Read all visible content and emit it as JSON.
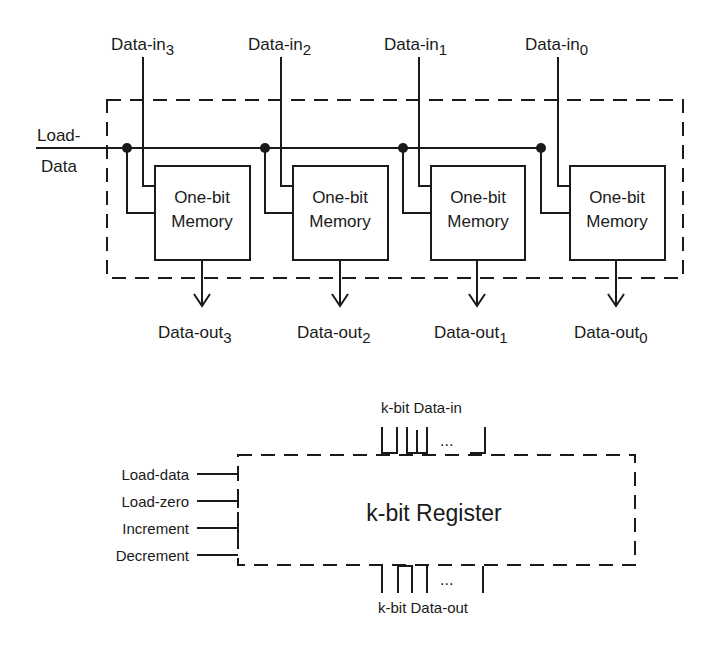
{
  "top_diagram": {
    "load_label_line1": "Load-",
    "load_label_line2": "Data",
    "data_in": [
      {
        "base": "Data-in",
        "sub": "3"
      },
      {
        "base": "Data-in",
        "sub": "2"
      },
      {
        "base": "Data-in",
        "sub": "1"
      },
      {
        "base": "Data-in",
        "sub": "0"
      }
    ],
    "cells": [
      {
        "line1": "One-bit",
        "line2": "Memory"
      },
      {
        "line1": "One-bit",
        "line2": "Memory"
      },
      {
        "line1": "One-bit",
        "line2": "Memory"
      },
      {
        "line1": "One-bit",
        "line2": "Memory"
      }
    ],
    "data_out": [
      {
        "base": "Data-out",
        "sub": "3"
      },
      {
        "base": "Data-out",
        "sub": "2"
      },
      {
        "base": "Data-out",
        "sub": "1"
      },
      {
        "base": "Data-out",
        "sub": "0"
      }
    ]
  },
  "bottom_diagram": {
    "data_in_label": "k-bit Data-in",
    "data_out_label": "k-bit Data-out",
    "register_label": "k-bit Register",
    "ellipsis": "...",
    "controls": [
      "Load-data",
      "Load-zero",
      "Increment",
      "Decrement"
    ]
  }
}
